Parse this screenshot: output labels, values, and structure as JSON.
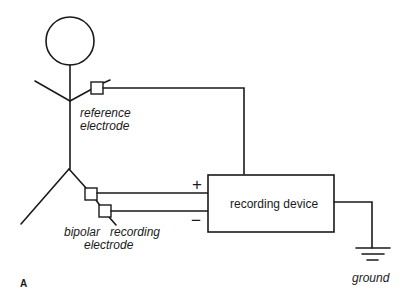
{
  "diagram": {
    "panel_label": "A",
    "labels": {
      "reference_electrode_line1": "reference",
      "reference_electrode_line2": "electrode",
      "bipolar_line1": "bipolar",
      "recording_word": "recording",
      "bipolar_line2": "electrode",
      "device": "recording device",
      "ground": "ground",
      "plus": "+",
      "minus": "−"
    },
    "colors": {
      "stroke": "#1a1a1a",
      "background": "#ffffff",
      "electrode_fill": "dotted"
    }
  }
}
